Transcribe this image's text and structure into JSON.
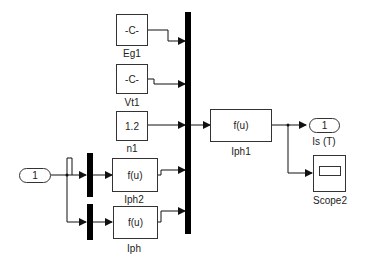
{
  "diagram": {
    "blocks": {
      "eg1": {
        "text": "-C-",
        "label": "Eg1"
      },
      "vt1": {
        "text": "-C-",
        "label": "Vt1"
      },
      "n1": {
        "text": "1.2",
        "label": "n1"
      },
      "iph2": {
        "text": "f(u)",
        "label": "Iph2"
      },
      "iph": {
        "text": "f(u)",
        "label": "Iph"
      },
      "iph1": {
        "text": "f(u)",
        "label": "Iph1"
      },
      "scope2": {
        "label": "Scope2"
      }
    },
    "ports": {
      "inport": {
        "text": "1"
      },
      "outport": {
        "text": "1",
        "label": "Is (T)"
      }
    }
  }
}
